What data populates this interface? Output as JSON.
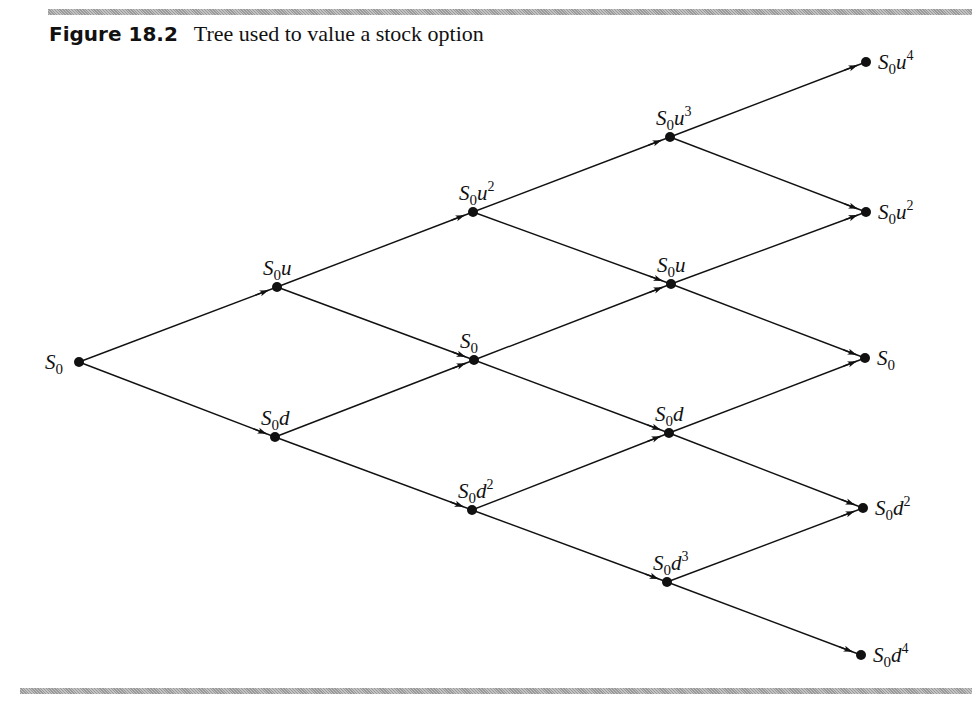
{
  "figure": {
    "number": "Figure 18.2",
    "title": "Tree used to value a stock option"
  },
  "tree": {
    "nodes": [
      {
        "id": "n0_0",
        "label": "S0",
        "base": "S",
        "sub": "0",
        "var": "",
        "exp": "",
        "x": 79,
        "y": 362,
        "label_pos": "left"
      },
      {
        "id": "n1_u",
        "label": "S0u",
        "base": "S",
        "sub": "0",
        "var": "u",
        "exp": "",
        "x": 277,
        "y": 287,
        "label_pos": "above"
      },
      {
        "id": "n1_d",
        "label": "S0d",
        "base": "S",
        "sub": "0",
        "var": "d",
        "exp": "",
        "x": 275,
        "y": 437,
        "label_pos": "above"
      },
      {
        "id": "n2_uu",
        "label": "S0u^2",
        "base": "S",
        "sub": "0",
        "var": "u",
        "exp": "2",
        "x": 473,
        "y": 212,
        "label_pos": "above"
      },
      {
        "id": "n2_ud",
        "label": "S0",
        "base": "S",
        "sub": "0",
        "var": "",
        "exp": "",
        "x": 474,
        "y": 360,
        "label_pos": "above"
      },
      {
        "id": "n2_dd",
        "label": "S0d^2",
        "base": "S",
        "sub": "0",
        "var": "d",
        "exp": "2",
        "x": 472,
        "y": 510,
        "label_pos": "above"
      },
      {
        "id": "n3_uuu",
        "label": "S0u^3",
        "base": "S",
        "sub": "0",
        "var": "u",
        "exp": "3",
        "x": 670,
        "y": 137,
        "label_pos": "above"
      },
      {
        "id": "n3_u",
        "label": "S0u",
        "base": "S",
        "sub": "0",
        "var": "u",
        "exp": "",
        "x": 671,
        "y": 284,
        "label_pos": "above"
      },
      {
        "id": "n3_d",
        "label": "S0d",
        "base": "S",
        "sub": "0",
        "var": "d",
        "exp": "",
        "x": 669,
        "y": 433,
        "label_pos": "above"
      },
      {
        "id": "n3_ddd",
        "label": "S0d^3",
        "base": "S",
        "sub": "0",
        "var": "d",
        "exp": "3",
        "x": 667,
        "y": 582,
        "label_pos": "above"
      },
      {
        "id": "n4_u4",
        "label": "S0u^4",
        "base": "S",
        "sub": "0",
        "var": "u",
        "exp": "4",
        "x": 866,
        "y": 62,
        "label_pos": "right"
      },
      {
        "id": "n4_u2",
        "label": "S0u^2",
        "base": "S",
        "sub": "0",
        "var": "u",
        "exp": "2",
        "x": 866,
        "y": 212,
        "label_pos": "right"
      },
      {
        "id": "n4_0",
        "label": "S0",
        "base": "S",
        "sub": "0",
        "var": "",
        "exp": "",
        "x": 865,
        "y": 358,
        "label_pos": "right"
      },
      {
        "id": "n4_d2",
        "label": "S0d^2",
        "base": "S",
        "sub": "0",
        "var": "d",
        "exp": "2",
        "x": 863,
        "y": 508,
        "label_pos": "right"
      },
      {
        "id": "n4_d4",
        "label": "S0d^4",
        "base": "S",
        "sub": "0",
        "var": "d",
        "exp": "4",
        "x": 861,
        "y": 655,
        "label_pos": "right"
      }
    ],
    "edges": [
      [
        "n0_0",
        "n1_u"
      ],
      [
        "n0_0",
        "n1_d"
      ],
      [
        "n1_u",
        "n2_uu"
      ],
      [
        "n1_u",
        "n2_ud"
      ],
      [
        "n1_d",
        "n2_ud"
      ],
      [
        "n1_d",
        "n2_dd"
      ],
      [
        "n2_uu",
        "n3_uuu"
      ],
      [
        "n2_uu",
        "n3_u"
      ],
      [
        "n2_ud",
        "n3_u"
      ],
      [
        "n2_ud",
        "n3_d"
      ],
      [
        "n2_dd",
        "n3_d"
      ],
      [
        "n2_dd",
        "n3_ddd"
      ],
      [
        "n3_uuu",
        "n4_u4"
      ],
      [
        "n3_uuu",
        "n4_u2"
      ],
      [
        "n3_u",
        "n4_u2"
      ],
      [
        "n3_u",
        "n4_0"
      ],
      [
        "n3_d",
        "n4_0"
      ],
      [
        "n3_d",
        "n4_d2"
      ],
      [
        "n3_ddd",
        "n4_d2"
      ],
      [
        "n3_ddd",
        "n4_d4"
      ]
    ]
  }
}
